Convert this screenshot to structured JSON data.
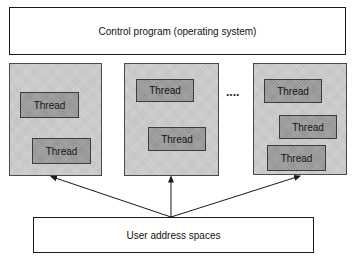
{
  "diagram": {
    "control_program": {
      "label": "Control program (operating system)"
    },
    "user_address_spaces": {
      "label": "User address spaces"
    },
    "ellipsis": "....",
    "spaces": [
      {
        "threads": [
          {
            "label": "Thread"
          },
          {
            "label": "Thread"
          }
        ]
      },
      {
        "threads": [
          {
            "label": "Thread"
          },
          {
            "label": "Thread"
          }
        ]
      },
      {
        "threads": [
          {
            "label": "Thread"
          },
          {
            "label": "Thread"
          },
          {
            "label": "Thread"
          }
        ]
      }
    ],
    "colors": {
      "space_fill": "#cbcbcb",
      "thread_fill": "#9c9c9c",
      "border": "#1a1a1a",
      "background": "#ffffff"
    }
  }
}
